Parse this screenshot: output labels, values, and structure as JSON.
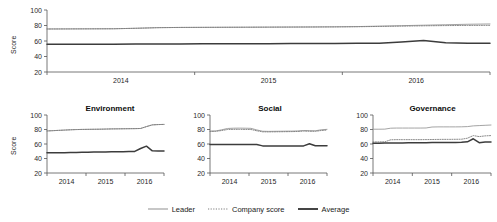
{
  "figure": {
    "ylabel": "Score",
    "yticks": [
      100,
      80,
      60,
      40,
      20
    ],
    "ylim": [
      20,
      100
    ],
    "xticks": [
      "2014",
      "2015",
      "2016"
    ],
    "colors": {
      "leader": "#9a9a9a",
      "company_score": "#7d7d7d",
      "average": "#3c3c3c",
      "axis": "#555555"
    }
  },
  "legend": {
    "position": "bottom-center",
    "items": [
      {
        "label": "Leader",
        "style": "solid-thin",
        "color": "#9a9a9a"
      },
      {
        "label": "Company score",
        "style": "dotted",
        "color": "#7d7d7d"
      },
      {
        "label": "Average",
        "style": "solid-thick",
        "color": "#3c3c3c"
      }
    ]
  },
  "chart_data": [
    {
      "id": "overall",
      "type": "line",
      "title": "",
      "xlabel": "",
      "ylabel": "Score",
      "ylim": [
        20,
        100
      ],
      "xticks": [
        "2014",
        "2015",
        "2016"
      ],
      "grid": false,
      "x": [
        0,
        0.05,
        0.1,
        0.15,
        0.2,
        0.25,
        0.3,
        0.35,
        0.4,
        0.45,
        0.5,
        0.55,
        0.6,
        0.65,
        0.7,
        0.75,
        0.8,
        0.85,
        0.9,
        0.95,
        1.0
      ],
      "series": [
        {
          "name": "Leader",
          "values": [
            75.5,
            75.6,
            75.7,
            75.8,
            76.4,
            77.2,
            77.5,
            77.6,
            77.7,
            77.8,
            77.9,
            78.0,
            78.1,
            78.3,
            78.6,
            79.2,
            79.8,
            80.4,
            81.0,
            81.6,
            82.0
          ]
        },
        {
          "name": "Company score",
          "values": [
            75.5,
            75.6,
            75.7,
            75.8,
            76.4,
            77.2,
            77.5,
            77.6,
            77.7,
            77.8,
            77.9,
            78.0,
            78.1,
            78.2,
            78.4,
            78.8,
            79.2,
            79.6,
            79.9,
            80.1,
            80.2
          ]
        },
        {
          "name": "Average",
          "values": [
            55.8,
            55.8,
            55.8,
            55.9,
            56.0,
            56.1,
            56.2,
            56.3,
            56.4,
            56.5,
            56.6,
            56.7,
            56.8,
            56.9,
            57.0,
            57.1,
            58.8,
            60.8,
            57.6,
            57.2,
            57.2
          ]
        }
      ]
    },
    {
      "id": "environment",
      "type": "line",
      "title": "Environment",
      "xlabel": "",
      "ylabel": "Score",
      "ylim": [
        20,
        100
      ],
      "xticks": [
        "2014",
        "2015",
        "2016"
      ],
      "grid": false,
      "x": [
        0,
        0.05,
        0.1,
        0.15,
        0.2,
        0.25,
        0.3,
        0.35,
        0.4,
        0.45,
        0.5,
        0.55,
        0.6,
        0.65,
        0.7,
        0.75,
        0.8,
        0.85,
        0.9,
        0.95,
        1.0
      ],
      "series": [
        {
          "name": "Leader",
          "values": [
            78.0,
            78.4,
            78.8,
            79.2,
            79.6,
            79.9,
            80.1,
            80.2,
            80.3,
            80.4,
            80.6,
            80.8,
            80.9,
            81.0,
            81.1,
            81.2,
            81.4,
            84.0,
            86.4,
            86.8,
            87.0
          ]
        },
        {
          "name": "Company score",
          "values": [
            78.0,
            78.4,
            78.8,
            79.2,
            79.6,
            79.9,
            80.1,
            80.2,
            80.3,
            80.4,
            80.6,
            80.8,
            80.9,
            81.0,
            81.1,
            81.2,
            81.4,
            84.0,
            86.4,
            86.8,
            87.0
          ]
        },
        {
          "name": "Average",
          "values": [
            47.8,
            47.9,
            48.0,
            48.1,
            48.2,
            48.4,
            48.5,
            48.6,
            48.8,
            48.9,
            49.0,
            49.2,
            49.3,
            49.4,
            49.6,
            49.8,
            53.8,
            57.0,
            50.6,
            50.5,
            50.5
          ]
        }
      ]
    },
    {
      "id": "social",
      "type": "line",
      "title": "Social",
      "xlabel": "",
      "ylabel": "",
      "ylim": [
        20,
        100
      ],
      "xticks": [
        "2014",
        "2015",
        "2016"
      ],
      "grid": false,
      "x": [
        0,
        0.05,
        0.1,
        0.15,
        0.2,
        0.25,
        0.3,
        0.35,
        0.4,
        0.45,
        0.5,
        0.55,
        0.6,
        0.65,
        0.7,
        0.75,
        0.8,
        0.85,
        0.9,
        0.95,
        1.0
      ],
      "series": [
        {
          "name": "Leader",
          "values": [
            77.8,
            78.0,
            79.6,
            81.4,
            81.8,
            81.9,
            81.8,
            81.6,
            79.4,
            77.6,
            77.4,
            77.5,
            77.6,
            77.7,
            77.8,
            78.0,
            78.6,
            78.4,
            78.2,
            79.6,
            80.2
          ]
        },
        {
          "name": "Company score",
          "values": [
            77.4,
            77.5,
            78.6,
            80.0,
            80.2,
            80.2,
            80.1,
            80.0,
            78.2,
            76.8,
            76.7,
            76.8,
            76.9,
            77.0,
            77.1,
            77.3,
            77.8,
            77.6,
            77.5,
            78.6,
            79.2
          ]
        },
        {
          "name": "Average",
          "values": [
            59.2,
            59.2,
            59.2,
            59.2,
            59.2,
            59.2,
            59.2,
            59.2,
            59.2,
            57.4,
            57.2,
            57.2,
            57.2,
            57.2,
            57.2,
            57.2,
            57.4,
            60.4,
            57.6,
            57.6,
            57.6
          ]
        }
      ]
    },
    {
      "id": "governance",
      "type": "line",
      "title": "Governance",
      "xlabel": "",
      "ylabel": "",
      "ylim": [
        20,
        100
      ],
      "xticks": [
        "2014",
        "2015",
        "2016"
      ],
      "grid": false,
      "x": [
        0,
        0.05,
        0.1,
        0.15,
        0.2,
        0.25,
        0.3,
        0.35,
        0.4,
        0.45,
        0.5,
        0.55,
        0.6,
        0.65,
        0.7,
        0.75,
        0.8,
        0.85,
        0.9,
        0.95,
        1.0
      ],
      "series": [
        {
          "name": "Leader",
          "values": [
            80.4,
            80.4,
            80.5,
            81.8,
            82.0,
            82.0,
            82.0,
            82.0,
            82.0,
            82.1,
            83.4,
            83.6,
            83.6,
            83.6,
            83.6,
            83.7,
            84.0,
            85.0,
            85.4,
            85.8,
            86.2
          ]
        },
        {
          "name": "Company score",
          "values": [
            62.8,
            62.9,
            63.0,
            65.8,
            66.0,
            66.0,
            66.0,
            66.0,
            66.0,
            66.1,
            66.2,
            66.3,
            66.4,
            66.4,
            66.5,
            66.6,
            68.0,
            71.6,
            70.2,
            71.2,
            71.6
          ]
        },
        {
          "name": "Average",
          "values": [
            61.2,
            61.2,
            61.3,
            61.4,
            61.5,
            61.5,
            61.6,
            61.6,
            61.7,
            61.8,
            61.9,
            62.0,
            62.0,
            62.1,
            62.2,
            62.3,
            63.0,
            67.2,
            61.8,
            62.6,
            62.8
          ]
        }
      ]
    }
  ]
}
